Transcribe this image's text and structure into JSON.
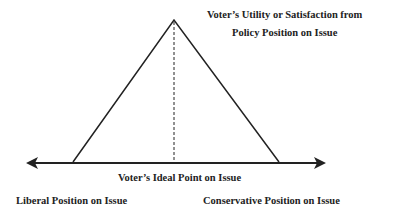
{
  "diagram": {
    "title_line1": "Voter’s Utility or Satisfaction from",
    "title_line2": "Policy Position on Issue",
    "axis_label": "Voter’s Ideal Point on Issue",
    "left_label": "Liberal Position on Issue",
    "right_label": "Conservative Position on Issue",
    "line_color": "#222222"
  }
}
